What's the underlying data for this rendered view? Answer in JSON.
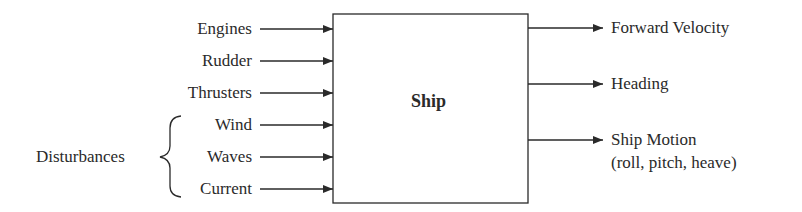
{
  "diagram": {
    "block": {
      "label": "Ship"
    },
    "inputs": [
      {
        "label": "Engines"
      },
      {
        "label": "Rudder"
      },
      {
        "label": "Thrusters"
      },
      {
        "label": "Wind"
      },
      {
        "label": "Waves"
      },
      {
        "label": "Current"
      }
    ],
    "disturbances_group": {
      "label": "Disturbances",
      "members": [
        "Wind",
        "Waves",
        "Current"
      ]
    },
    "outputs": [
      {
        "label": "Forward Velocity"
      },
      {
        "label": "Heading"
      },
      {
        "label": "Ship Motion",
        "sublabel": "(roll, pitch, heave)"
      }
    ],
    "colors": {
      "stroke": "#2a2a2a",
      "background": "#ffffff"
    }
  }
}
